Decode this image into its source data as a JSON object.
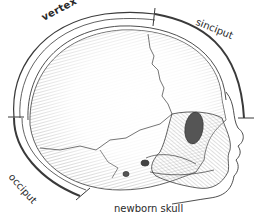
{
  "diagram": {
    "type": "anatomical-illustration",
    "caption": "newborn skull",
    "labels": {
      "vertex": "vertex",
      "sinciput": "sinciput",
      "occiput": "occiput"
    },
    "colors": {
      "line": "#3a3a3a",
      "hatch": "#8a8a8a",
      "background": "#ffffff",
      "orbit_fill": "#555555"
    }
  }
}
